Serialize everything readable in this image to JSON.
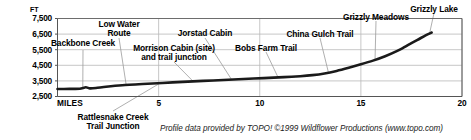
{
  "chart_data": {
    "type": "line",
    "title": "",
    "subtitle": "",
    "xlabel": "MILES",
    "ylabel": "FT",
    "ylabel_full": "FT",
    "xlim": [
      0,
      20
    ],
    "ylim": [
      2500,
      7500
    ],
    "grid": true,
    "legend": null,
    "y_ticks": [
      "2,500",
      "3,500",
      "4,500",
      "5,500",
      "6,500",
      "7,500"
    ],
    "y_tick_values": [
      2500,
      3500,
      4500,
      5500,
      6500,
      7500
    ],
    "x_ticks": [
      "MILES",
      "5",
      "10",
      "15",
      "20"
    ],
    "x_tick_values": [
      0,
      5,
      10,
      15,
      20
    ],
    "series": [
      {
        "name": "Trail elevation profile",
        "x": [
          0.0,
          0.6,
          1.1,
          1.4,
          1.6,
          1.9,
          2.4,
          3.2,
          4.2,
          5.2,
          6.2,
          7.2,
          8.2,
          9.2,
          10.2,
          11.2,
          12.0,
          12.6,
          13.2,
          13.8,
          14.4,
          15.0,
          15.6,
          16.2,
          16.8,
          17.3,
          17.8,
          18.2,
          18.5
        ],
        "y": [
          2980,
          2990,
          3000,
          3090,
          3020,
          3040,
          3120,
          3220,
          3300,
          3370,
          3440,
          3500,
          3560,
          3620,
          3680,
          3740,
          3800,
          3870,
          3980,
          4140,
          4340,
          4560,
          4800,
          5080,
          5420,
          5780,
          6130,
          6420,
          6600
        ]
      }
    ],
    "annotations": [
      {
        "id": "backbone-creek",
        "label": "Backbone Creek",
        "lines": [
          "Backbone Creek"
        ],
        "x_mile": 1.25,
        "elev": 3050
      },
      {
        "id": "low-water-route",
        "label": "Low Water Route",
        "lines": [
          "Low Water",
          "Route"
        ],
        "x_mile": 3.4,
        "elev": 3210
      },
      {
        "id": "rattlesnake-creek-tj",
        "label": "Rattlesnake Creek Trail Junction",
        "lines": [
          "Rattlesnake Creek",
          "Trail Junction"
        ],
        "x_mile": 5.1,
        "elev": 3380
      },
      {
        "id": "morrison-cabin",
        "label": "Morrison Cabin (site) and trail junction",
        "lines": [
          "Morrison Cabin (site)",
          "and trail junction"
        ],
        "x_mile": 6.7,
        "elev": 3480
      },
      {
        "id": "jorstad-cabin",
        "label": "Jorstad Cabin",
        "lines": [
          "Jorstad Cabin"
        ],
        "x_mile": 8.6,
        "elev": 3600
      },
      {
        "id": "bobs-farm-trail",
        "label": "Bobs Farm Trail",
        "lines": [
          "Bobs Farm Trail"
        ],
        "x_mile": 10.9,
        "elev": 3740
      },
      {
        "id": "china-gulch-trail",
        "label": "China Gulch Trail",
        "lines": [
          "China Gulch Trail"
        ],
        "x_mile": 13.4,
        "elev": 4020
      },
      {
        "id": "grizzly-meadows",
        "label": "Grizzly Meadows",
        "lines": [
          "Grizzly Meadows"
        ],
        "x_mile": 15.7,
        "elev": 4860
      },
      {
        "id": "grizzly-lake",
        "label": "Grizzly Lake",
        "lines": [
          "Grizzly Lake"
        ],
        "x_mile": 18.4,
        "elev": 6560
      }
    ],
    "credit": "Profile data provided by TOPO! ©1999 Wildflower Productions (www.topo.com)",
    "colors": {
      "profile_line": "#1a1a1a",
      "grid": "#b9b9b9",
      "axis": "#555555",
      "leader": "#9a9a9a",
      "text": "#000000",
      "background": "#ffffff"
    }
  }
}
